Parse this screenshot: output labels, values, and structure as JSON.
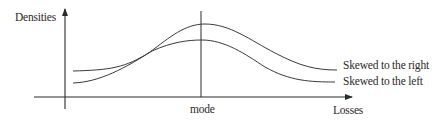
{
  "diagram": {
    "y_axis_label": "Densities",
    "x_axis_label": "Losses",
    "mode_label": "mode",
    "curves": [
      {
        "name": "skewed-right",
        "label": "Skewed to the right"
      },
      {
        "name": "skewed-left",
        "label": "Skewed to the left"
      }
    ],
    "colors": {
      "line": "#3a3a3a",
      "text": "#2a2a2a",
      "background": "#ffffff"
    }
  }
}
